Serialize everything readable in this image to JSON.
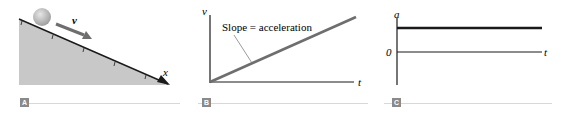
{
  "colors": {
    "incline_fill": "#c8c8c8",
    "line": "#1a1a1a",
    "arrow": "#6e6e6e",
    "ball": "#b0b0b0",
    "graph_line": "#6e6e6e",
    "badge_bg": "#8a8a8a",
    "rule": "#d8d8d8"
  },
  "panels": [
    {
      "id": "A",
      "badge": "A",
      "velocity_label": "v⃗",
      "axis_label": "x"
    },
    {
      "id": "B",
      "badge": "B",
      "y_axis_label": "v",
      "x_axis_label": "t",
      "annotation": "Slope = acceleration"
    },
    {
      "id": "C",
      "badge": "C",
      "y_axis_label": "a",
      "x_axis_label": "t",
      "zero_label": "0"
    }
  ]
}
